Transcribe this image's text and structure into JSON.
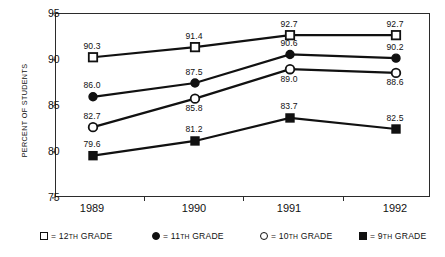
{
  "chart_data": {
    "type": "line",
    "title": "",
    "xlabel": "",
    "ylabel": "PERCENT OF STUDENTS",
    "categories": [
      "1989",
      "1990",
      "1991",
      "1992"
    ],
    "ylim": [
      75,
      95
    ],
    "yticks": [
      "75",
      "80",
      "85",
      "90",
      "95"
    ],
    "grid": false,
    "legend_position": "bottom",
    "series": [
      {
        "name": "12TH GRADE",
        "marker": "open-square",
        "values": [
          90.3,
          91.4,
          92.7,
          92.7
        ],
        "labels": [
          "90.3",
          "91.4",
          "92.7",
          "92.7"
        ],
        "label_positions": [
          "above",
          "above",
          "above",
          "above"
        ]
      },
      {
        "name": "11TH GRADE",
        "marker": "filled-circle",
        "values": [
          86.0,
          87.5,
          90.6,
          90.2
        ],
        "labels": [
          "86.0",
          "87.5",
          "90.6",
          "90.2"
        ],
        "label_positions": [
          "above",
          "above",
          "above",
          "above"
        ]
      },
      {
        "name": "10TH GRADE",
        "marker": "open-circle",
        "values": [
          82.7,
          85.8,
          89.0,
          88.6
        ],
        "labels": [
          "82.7",
          "85.8",
          "89.0",
          "88.6"
        ],
        "label_positions": [
          "above",
          "below",
          "below",
          "below"
        ]
      },
      {
        "name": "9TH GRADE",
        "marker": "filled-square",
        "values": [
          79.6,
          81.2,
          83.7,
          82.5
        ],
        "labels": [
          "79.6",
          "81.2",
          "83.7",
          "82.5"
        ],
        "label_positions": [
          "above",
          "above",
          "above",
          "above"
        ]
      }
    ],
    "legend": [
      {
        "marker": "open-square",
        "prefix": "= ",
        "grade": "12",
        "suffix": "TH GRADE"
      },
      {
        "marker": "filled-circle",
        "prefix": "= ",
        "grade": "11",
        "suffix": "TH GRADE"
      },
      {
        "marker": "open-circle",
        "prefix": "= ",
        "grade": "10",
        "suffix": "TH GRADE"
      },
      {
        "marker": "filled-square",
        "prefix": "= ",
        "grade": "9",
        "suffix": "TH GRADE"
      }
    ],
    "colors": {
      "line": "#111111",
      "marker_fill": "#111111",
      "marker_open": "#ffffff",
      "axis": "#2b2b2b"
    }
  }
}
